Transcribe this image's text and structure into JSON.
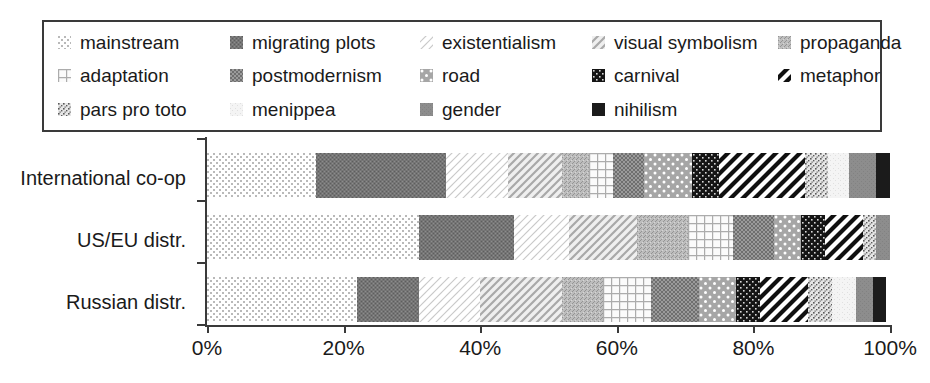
{
  "legend": {
    "items": [
      {
        "label": "mainstream",
        "key": "mainstream",
        "pattern": "dots-sparse-light",
        "color": "#e8e8e8"
      },
      {
        "label": "migrating plots",
        "key": "migrating_plots",
        "pattern": "noise-dark",
        "color": "#7a7a7a"
      },
      {
        "label": "existentialism",
        "key": "existentialism",
        "pattern": "diag-thin-light",
        "color": "#f2f2f2"
      },
      {
        "label": "visual symbolism",
        "key": "visual_symbolism",
        "pattern": "diag-med",
        "color": "#cfcfcf"
      },
      {
        "label": "propaganda",
        "key": "propaganda",
        "pattern": "noise-med",
        "color": "#b5b5b5"
      },
      {
        "label": "adaptation",
        "key": "adaptation",
        "pattern": "grid-fine",
        "color": "#dcdcdc"
      },
      {
        "label": "postmodernism",
        "key": "postmodernism",
        "pattern": "checker-dark",
        "color": "#9a9a9a"
      },
      {
        "label": "road",
        "key": "road",
        "pattern": "dots-white-on-gray",
        "color": "#a8a8a8"
      },
      {
        "label": "carnival",
        "key": "carnival",
        "pattern": "black-dots",
        "color": "#1c1c1c"
      },
      {
        "label": "metaphor",
        "key": "metaphor",
        "pattern": "diag-bold-black",
        "color": "#222222"
      },
      {
        "label": "pars pro toto",
        "key": "pars_pro_toto",
        "pattern": "speckle",
        "color": "#bdbdbd"
      },
      {
        "label": "menippea",
        "key": "menippea",
        "pattern": "very-light",
        "color": "#efefef"
      },
      {
        "label": "gender",
        "key": "gender",
        "pattern": "solid-gray",
        "color": "#8f8f8f"
      },
      {
        "label": "nihilism",
        "key": "nihilism",
        "pattern": "solid-black",
        "color": "#1a1a1a"
      }
    ]
  },
  "axis": {
    "ticks": [
      "0%",
      "20%",
      "40%",
      "60%",
      "80%",
      "100%"
    ],
    "tick_values": [
      0,
      20,
      40,
      60,
      80,
      100
    ],
    "min": 0,
    "max": 100
  },
  "categories": [
    "International co-op",
    "US/EU distr.",
    "Russian distr."
  ],
  "chart_data": {
    "type": "bar",
    "orientation": "horizontal",
    "stacked": true,
    "normalized_percent": true,
    "title": "",
    "xlabel": "",
    "ylabel": "",
    "xlim": [
      0,
      100
    ],
    "grid": false,
    "legend_position": "top",
    "categories": [
      "International co-op",
      "US/EU distr.",
      "Russian distr."
    ],
    "xtick_labels": [
      "0%",
      "20%",
      "40%",
      "60%",
      "80%",
      "100%"
    ],
    "series": [
      {
        "name": "mainstream",
        "values": [
          16.0,
          31.0,
          22.0
        ]
      },
      {
        "name": "migrating plots",
        "values": [
          19.0,
          14.0,
          9.0
        ]
      },
      {
        "name": "existentialism",
        "values": [
          9.0,
          8.0,
          9.0
        ]
      },
      {
        "name": "visual symbolism",
        "values": [
          8.0,
          10.0,
          12.0
        ]
      },
      {
        "name": "propaganda",
        "values": [
          4.0,
          7.5,
          6.0
        ]
      },
      {
        "name": "adaptation",
        "values": [
          3.5,
          6.5,
          7.0
        ]
      },
      {
        "name": "postmodernism",
        "values": [
          4.5,
          6.0,
          7.0
        ]
      },
      {
        "name": "road",
        "values": [
          7.0,
          4.0,
          5.5
        ]
      },
      {
        "name": "carnival",
        "values": [
          4.0,
          3.5,
          3.5
        ]
      },
      {
        "name": "metaphor",
        "values": [
          12.5,
          5.5,
          7.0
        ]
      },
      {
        "name": "pars pro toto",
        "values": [
          3.5,
          2.0,
          3.5
        ]
      },
      {
        "name": "menippea",
        "values": [
          3.0,
          0.0,
          3.5
        ]
      },
      {
        "name": "gender",
        "values": [
          4.0,
          2.0,
          2.5
        ]
      },
      {
        "name": "nihilism",
        "values": [
          2.0,
          0.0,
          2.0
        ]
      }
    ]
  }
}
